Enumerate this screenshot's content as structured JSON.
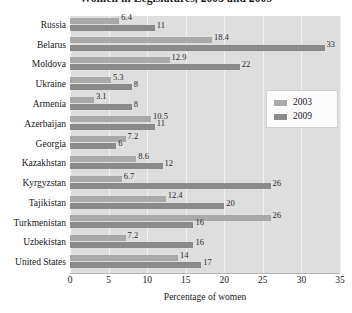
{
  "chart_data": {
    "type": "bar",
    "orientation": "horizontal",
    "title": "Women in Legislatures, 2003 and 2009",
    "xlabel": "Percentage of women",
    "ylabel": "",
    "xlim": [
      0,
      35
    ],
    "xticks": [
      0,
      5,
      10,
      15,
      20,
      25,
      30,
      35
    ],
    "xtick_labels": [
      "0",
      "5",
      "10",
      "15",
      "20",
      "25",
      "30",
      "35"
    ],
    "grid": true,
    "grid_axis": "x",
    "legend_position": "right",
    "categories": [
      "Russia",
      "Belarus",
      "Moldova",
      "Ukraine",
      "Armenia",
      "Azerbaijan",
      "Georgia",
      "Kazakhstan",
      "Kyrgyzstan",
      "Tajikistan",
      "Turkmenistan",
      "Uzbekistan",
      "United States"
    ],
    "series": [
      {
        "name": "2003",
        "color": "#a9a9a9",
        "values": [
          6.4,
          18.4,
          12.9,
          5.3,
          3.1,
          10.5,
          7.2,
          8.6,
          6.7,
          12.4,
          26,
          7.2,
          14
        ],
        "value_labels": [
          "6.4",
          "18.4",
          "12.9",
          "5.3",
          "3.1",
          "10.5",
          "7.2",
          "8.6",
          "6.7",
          "12.4",
          "26",
          "7.2",
          "14"
        ]
      },
      {
        "name": "2009",
        "color": "#8a8a8a",
        "values": [
          11,
          33,
          22,
          8,
          8,
          11,
          6,
          12,
          26,
          20,
          16,
          16,
          17
        ],
        "value_labels": [
          "11",
          "33",
          "22",
          "8",
          "8",
          "11",
          "6",
          "12",
          "26",
          "20",
          "16",
          "16",
          "17"
        ]
      }
    ]
  },
  "legend": {
    "entries": [
      {
        "label": "2003",
        "swatch": "legend-swatch-2003"
      },
      {
        "label": "2009",
        "swatch": "legend-swatch-2009"
      }
    ]
  },
  "colors": {
    "series_2003": "#a9a9a9",
    "series_2009": "#8a8a8a",
    "plot_background": "#dedede",
    "gridline": "#f2f2f2",
    "text": "#17171b",
    "page_background": "#ffffff"
  }
}
